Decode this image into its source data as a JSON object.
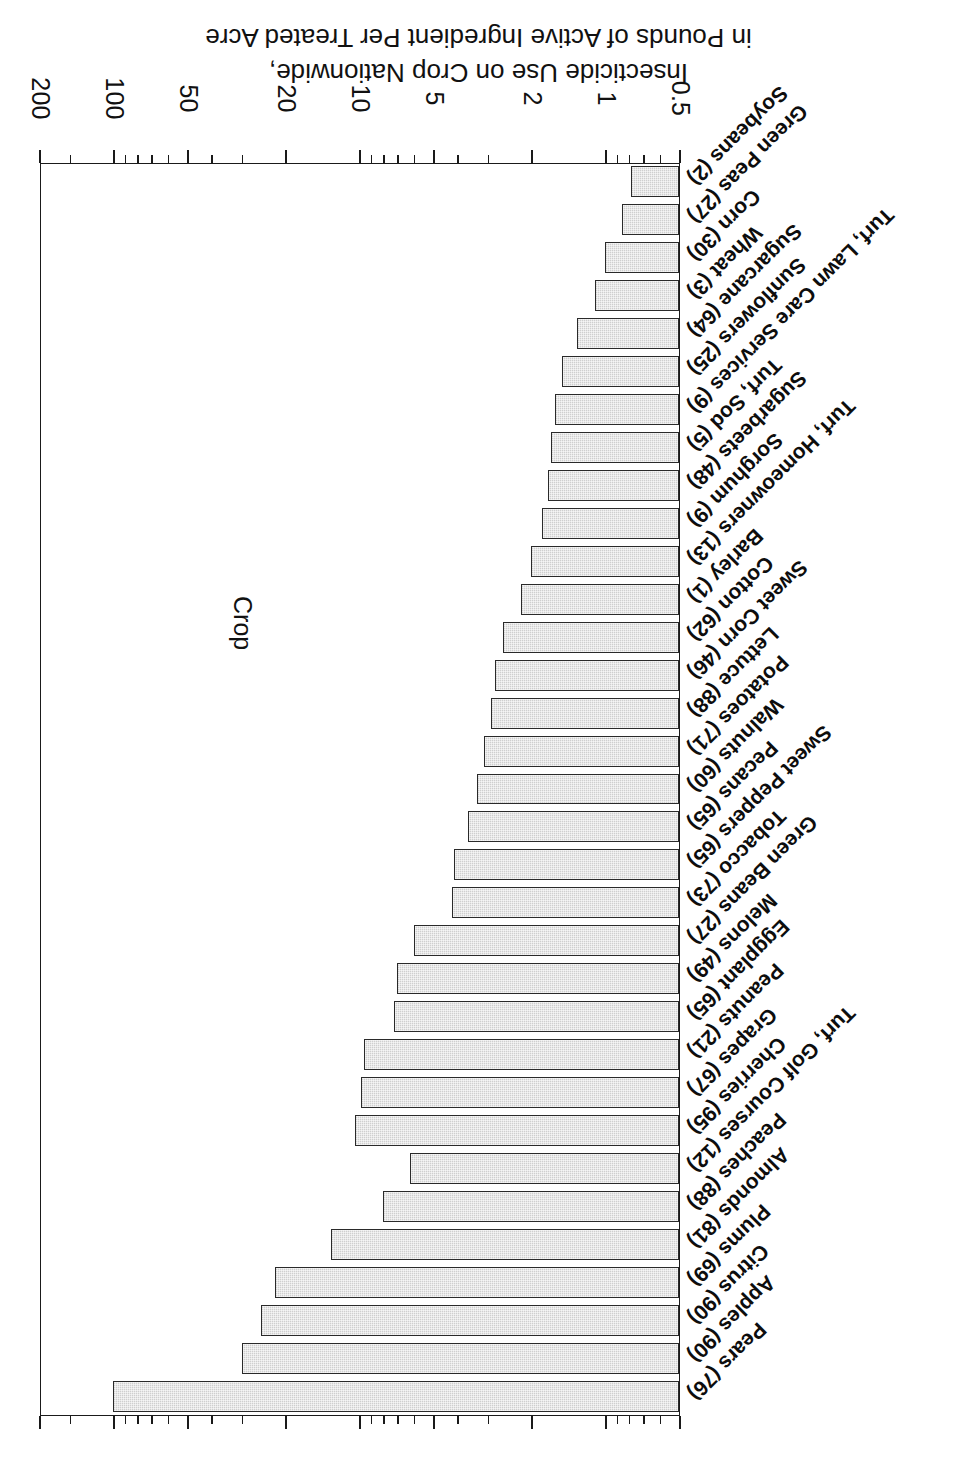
{
  "chart_data": {
    "type": "bar",
    "orientation": "horizontal",
    "title": "",
    "xlabel": "Crop",
    "ylabel": "Insecticide Use on Crop Nationwide, in Pounds of Active Ingredient Per Treated Acre",
    "ylabel_lines": [
      "Insecticide Use on Crop Nationwide,",
      "in Pounds of Active Ingredient Per Treated Acre"
    ],
    "scale": "log",
    "ylim": [
      0.5,
      200
    ],
    "grid": false,
    "legend": "none",
    "tick_labels": [
      "0.5",
      "1",
      "2",
      "5",
      "10",
      "20",
      "50",
      "100",
      "200"
    ],
    "tick_values": [
      0.5,
      1,
      2,
      5,
      10,
      20,
      50,
      100,
      200
    ],
    "categories": [
      "Pears (76)",
      "Apples (90)",
      "Citrus (90)",
      "Plums (69)",
      "Almonds (81)",
      "Peaches (88)",
      "Turf, Golf Courses (12)",
      "Cherries (95)",
      "Grapes (67)",
      "Peanuts (21)",
      "Eggplant (65)",
      "Melons (49)",
      "Green Beans (27)",
      "Tobacco (73)",
      "Sweet Peppers (65)",
      "Pecans (65)",
      "Walnuts (60)",
      "Potatoes (71)",
      "Lettuce (88)",
      "Sweet Corn (46)",
      "Cotton (62)",
      "Barley (1)",
      "Turf, Homeowners (13)",
      "Sorghum (9)",
      "Sugarbeets (48)",
      "Turf, Sod (5)",
      "Turf, Lawn Care Services (9)",
      "Sunflowers (25)",
      "Sugarcane (64)",
      "Wheat (3)",
      "Corn (30)",
      "Green Peas (27)",
      "Soybeans (2)"
    ],
    "values": [
      100,
      30,
      25,
      22,
      13,
      8.0,
      6.2,
      10.4,
      9.8,
      9.5,
      7.2,
      7.0,
      6.0,
      4.2,
      4.1,
      3.6,
      3.3,
      3.1,
      2.9,
      2.8,
      2.6,
      2.2,
      2.0,
      1.8,
      1.7,
      1.65,
      1.6,
      1.5,
      1.3,
      1.1,
      1.0,
      0.85,
      0.78
    ],
    "bar_fill_color": "#cfcfcf",
    "bar_edge_color": "#2a2a2a",
    "axis_color": "#1a1a1a",
    "background_color": "#ffffff"
  },
  "page": {
    "rotation_degrees": 180
  }
}
